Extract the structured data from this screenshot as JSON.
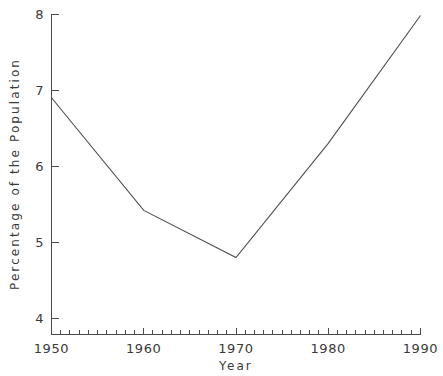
{
  "chart_data": {
    "type": "line",
    "title": "",
    "xlabel": "Year",
    "ylabel": "Percentage of the Population",
    "x": [
      1950,
      1960,
      1970,
      1980,
      1990
    ],
    "values": [
      6.9,
      5.42,
      4.8,
      6.3,
      7.98
    ],
    "series": [
      {
        "name": "Percentage of the Population",
        "values": [
          6.9,
          5.42,
          4.8,
          6.3,
          7.98
        ]
      }
    ],
    "xlim": [
      1950,
      1990
    ],
    "ylim": [
      4,
      8
    ],
    "x_tick_labels": [
      "1950",
      "1960",
      "1970",
      "1980",
      "1990"
    ],
    "y_tick_labels": [
      "4",
      "5",
      "6",
      "7",
      "8"
    ],
    "x_minor_tick_step": 1,
    "grid": false,
    "legend": false,
    "legend_position": "none",
    "line_color": "#4d4d4d",
    "axis_color": "#4a4a4a",
    "background_color": "#ffffff"
  },
  "axes": {
    "y_title": "Percentage of the Population",
    "x_title": "Year",
    "y_ticks": [
      {
        "label": "8",
        "value": 8
      },
      {
        "label": "7",
        "value": 7
      },
      {
        "label": "6",
        "value": 6
      },
      {
        "label": "5",
        "value": 5
      },
      {
        "label": "4",
        "value": 4
      }
    ],
    "x_ticks": [
      {
        "label": "1950",
        "value": 1950
      },
      {
        "label": "1960",
        "value": 1960
      },
      {
        "label": "1970",
        "value": 1970
      },
      {
        "label": "1980",
        "value": 1980
      },
      {
        "label": "1990",
        "value": 1990
      }
    ]
  },
  "labels": {
    "y_tick_8": "8",
    "y_tick_7": "7",
    "y_tick_6": "6",
    "y_tick_5": "5",
    "y_tick_4": "4",
    "x_tick_1950": "1950",
    "x_tick_1960": "1960",
    "x_tick_1970": "1970",
    "x_tick_1980": "1980",
    "x_tick_1990": "1990",
    "x_axis_title": "Year",
    "y_axis_title": "Percentage of the Population"
  }
}
